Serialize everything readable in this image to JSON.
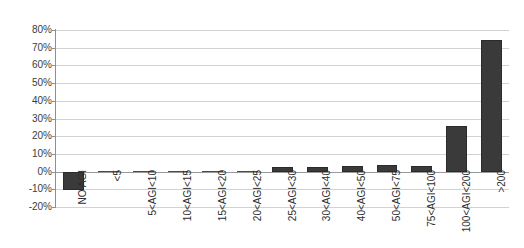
{
  "chart_data": {
    "type": "bar",
    "title": "",
    "subtitle": "",
    "xlabel": "",
    "ylabel": "",
    "ylim": [
      -20,
      80
    ],
    "ytick_step": 10,
    "grid": true,
    "legend": false,
    "bar_color": "#3a3a3a",
    "categories": [
      "NO AGI",
      "<5",
      "5<AGI<10",
      "10<AGI<15",
      "15<AGI<20",
      "20<AGI<25",
      "25<AGI<30",
      "30<AGI<40",
      "40<AGI<50",
      "50<AGI<75",
      "75<AGI<100",
      "100<AGI<200",
      ">200"
    ],
    "values": [
      -10.5,
      0.5,
      0.3,
      0.4,
      0.2,
      0.6,
      2.7,
      2.7,
      3.2,
      4.0,
      3.3,
      25.5,
      74.2
    ],
    "ytick_labels": [
      "80%",
      "70%",
      "60%",
      "50%",
      "40%",
      "30%",
      "20%",
      "10%",
      "0%",
      "-10%",
      "-20%"
    ],
    "ytick_values": [
      80,
      70,
      60,
      50,
      40,
      30,
      20,
      10,
      0,
      -10,
      -20
    ]
  }
}
